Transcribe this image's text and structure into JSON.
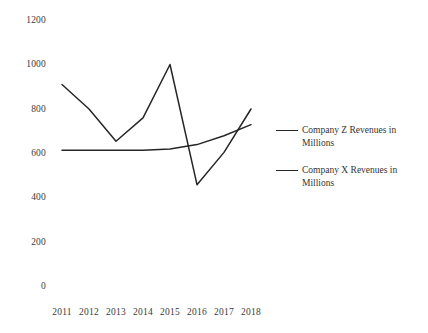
{
  "chart_data": {
    "type": "line",
    "title": "",
    "xlabel": "",
    "ylabel": "",
    "categories": [
      "2011",
      "2012",
      "2013",
      "2014",
      "2015",
      "2016",
      "2017",
      "2018"
    ],
    "ylim": [
      0,
      1200
    ],
    "yticks": [
      0,
      200,
      400,
      600,
      800,
      1000,
      1200
    ],
    "grid": false,
    "legend_position": "right",
    "series": [
      {
        "name": "Company Z Revenues in Millions",
        "values": [
          910,
          800,
          655,
          760,
          1000,
          460,
          605,
          800
        ],
        "color": "#262626"
      },
      {
        "name": "Company X Revenues in Millions",
        "values": [
          615,
          615,
          615,
          615,
          620,
          640,
          680,
          730
        ],
        "color": "#262626"
      }
    ]
  },
  "legend": {
    "entries": [
      {
        "label": "Company Z Revenues in Millions"
      },
      {
        "label": "Company X Revenues in Millions"
      }
    ]
  },
  "axes": {
    "y_tick_labels": [
      "1200",
      "1000",
      "800",
      "600",
      "400",
      "200",
      "0"
    ],
    "x_tick_labels": [
      "2011",
      "2012",
      "2013",
      "2014",
      "2015",
      "2016",
      "2017",
      "2018"
    ]
  }
}
